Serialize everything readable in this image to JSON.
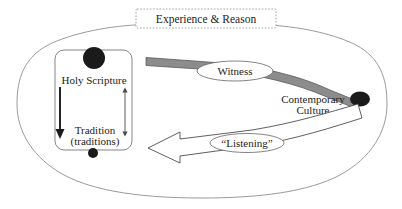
{
  "diagram": {
    "title_box": {
      "label": "Experience & Reason",
      "border_style": "dashed",
      "border_color": "#9a9a9a"
    },
    "outer_boundary": {
      "shape": "ellipse",
      "stroke_color": "#8f8f8f",
      "fill": "#ffffff"
    },
    "nodes": [
      {
        "id": "holy-scripture",
        "label": "Holy Scripture",
        "marker": "large-filled-circle",
        "marker_color": "#1a1a1a"
      },
      {
        "id": "tradition",
        "label_line1": "Tradition",
        "label_line2": "(traditions)",
        "marker": "small-filled-circle",
        "marker_color": "#1a1a1a"
      },
      {
        "id": "contemporary-culture",
        "label_line1": "Contemporary",
        "label_line2": "Culture",
        "marker": "filled-ellipse",
        "marker_color": "#1a1a1a"
      }
    ],
    "flows": [
      {
        "id": "witness",
        "label": "Witness",
        "style": "solid-gray-tapered-band",
        "fill_color": "#8c8c8c",
        "stroke_color": "#5a5a5a",
        "direction": "scripture-to-culture"
      },
      {
        "id": "listening",
        "label": "“Listening”",
        "style": "hollow-outline-arrow",
        "fill_color": "#ffffff",
        "stroke_color": "#4d4d4d",
        "direction": "culture-to-scripture"
      }
    ],
    "connectors": [
      {
        "id": "scripture-to-tradition",
        "type": "single-headed-arrow-down",
        "color": "#1a1a1a"
      },
      {
        "id": "scripture-tradition-bidirectional",
        "type": "double-headed-arrow-vertical",
        "color": "#4a4a4a"
      }
    ],
    "scripture_group_box": {
      "shape": "rounded-rectangle",
      "stroke_color": "#777777"
    }
  }
}
